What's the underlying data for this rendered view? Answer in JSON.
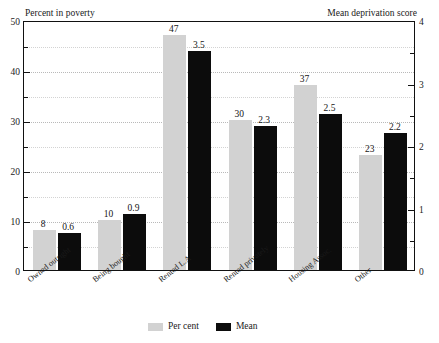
{
  "chart_data": {
    "type": "bar",
    "title": "",
    "categories": [
      "Owned outright",
      "Being bought",
      "Rented L.A",
      "Rented privately",
      "Housing Assoc.",
      "Other"
    ],
    "series": [
      {
        "name": "Per cent",
        "axis": "left",
        "color": "#d2d2d2",
        "values": [
          8,
          10,
          47,
          30,
          37,
          23
        ],
        "labels": [
          "8",
          "10",
          "47",
          "30",
          "37",
          "23"
        ]
      },
      {
        "name": "Mean",
        "axis": "right",
        "color": "#0c0c0c",
        "values": [
          0.6,
          0.9,
          3.5,
          2.3,
          2.5,
          2.2
        ],
        "labels": [
          "0.6",
          "0.9",
          "3.5",
          "2.3",
          "2.5",
          "2.2"
        ]
      }
    ],
    "xlabel": "",
    "ylabel_left": "Percent in poverty",
    "ylabel_right": "Mean deprivation score",
    "ylim_left": [
      0,
      50
    ],
    "ylim_right": [
      0,
      4
    ],
    "yticks_left": [
      "0",
      "10",
      "20",
      "30",
      "40",
      "50"
    ],
    "yticks_right": [
      "0",
      "1",
      "2",
      "3",
      "4"
    ],
    "ytick_values_left": [
      0,
      10,
      20,
      30,
      40,
      50
    ],
    "ytick_values_right": [
      0,
      1,
      2,
      3,
      4
    ],
    "yminor_values_left": [
      5,
      15,
      25,
      35,
      45
    ],
    "yminor_values_right": [
      0.5,
      1.5,
      2.5,
      3.5
    ],
    "grid": true,
    "legend_position": "bottom-center",
    "legend": [
      "Per cent",
      "Mean"
    ]
  }
}
